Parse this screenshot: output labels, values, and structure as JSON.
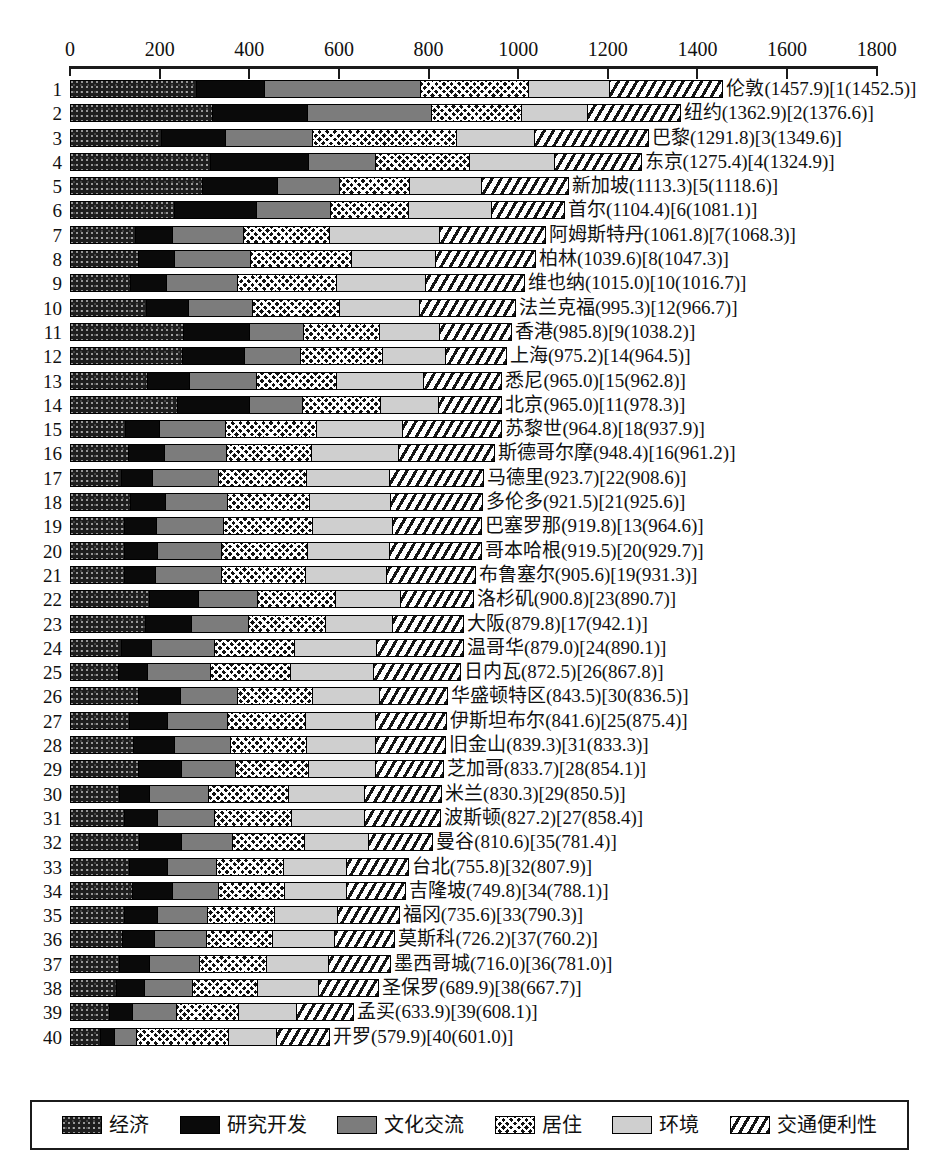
{
  "chart_data": {
    "type": "bar",
    "orientation": "horizontal",
    "stacked": true,
    "title": "",
    "xlabel": "",
    "ylabel": "",
    "xlim": [
      0,
      1800
    ],
    "xticks": [
      0,
      200,
      400,
      600,
      800,
      1000,
      1200,
      1400,
      1600,
      1800
    ],
    "grid": false,
    "legend_position": "bottom",
    "series": [
      {
        "name": "经济",
        "key": "economy",
        "pattern": "dark-speckle"
      },
      {
        "name": "研究开发",
        "key": "rnd",
        "pattern": "solid-black"
      },
      {
        "name": "文化交流",
        "key": "culture",
        "pattern": "solid-gray"
      },
      {
        "name": "居住",
        "key": "living",
        "pattern": "crosshatch"
      },
      {
        "name": "环境",
        "key": "environment",
        "pattern": "light-gray"
      },
      {
        "name": "交通便利性",
        "key": "accessibility",
        "pattern": "diagonal-hatch"
      }
    ],
    "rows": [
      {
        "rank": "1",
        "label": "伦敦(1457.9)[1(1452.5)]",
        "total": 1457.9,
        "values": [
          279,
          154,
          348,
          241,
          182,
          254
        ]
      },
      {
        "rank": "2",
        "label": "纽约(1362.9)[2(1376.6)]",
        "total": 1362.9,
        "values": [
          316,
          212,
          279,
          201,
          148,
          207
        ]
      },
      {
        "rank": "3",
        "label": "巴黎(1291.8)[3(1349.6)]",
        "total": 1291.8,
        "values": [
          202,
          143,
          195,
          322,
          175,
          255
        ]
      },
      {
        "rank": "4",
        "label": "东京(1275.4)[4(1324.9)]",
        "total": 1275.4,
        "values": [
          312,
          218,
          150,
          212,
          190,
          193
        ]
      },
      {
        "rank": "5",
        "label": "新加坡(1113.3)[5(1118.6)]",
        "total": 1113.3,
        "values": [
          294,
          168,
          138,
          158,
          160,
          195
        ]
      },
      {
        "rank": "6",
        "label": "首尔(1104.4)[6(1081.1)]",
        "total": 1104.4,
        "values": [
          230,
          185,
          165,
          175,
          185,
          164
        ]
      },
      {
        "rank": "7",
        "label": "阿姆斯特丹(1061.8)[7(1068.3)]",
        "total": 1061.8,
        "values": [
          144,
          82,
          160,
          193,
          246,
          237
        ]
      },
      {
        "rank": "8",
        "label": "柏林(1039.6)[8(1047.3)]",
        "total": 1039.6,
        "values": [
          150,
          80,
          172,
          225,
          188,
          225
        ]
      },
      {
        "rank": "9",
        "label": "维也纳(1015.0)[10(1016.7)]",
        "total": 1015.0,
        "values": [
          132,
          80,
          160,
          222,
          200,
          221
        ]
      },
      {
        "rank": "10",
        "label": "法兰克福(995.3)[12(966.7)]",
        "total": 995.3,
        "values": [
          168,
          95,
          142,
          195,
          180,
          215
        ]
      },
      {
        "rank": "11",
        "label": "香港(985.8)[9(1038.2)]",
        "total": 985.8,
        "values": [
          250,
          150,
          120,
          170,
          135,
          161
        ]
      },
      {
        "rank": "12",
        "label": "上海(975.2)[14(964.5)]",
        "total": 975.2,
        "values": [
          248,
          140,
          125,
          185,
          140,
          137
        ]
      },
      {
        "rank": "13",
        "label": "悉尼(965.0)[15(962.8)]",
        "total": 965.0,
        "values": [
          170,
          95,
          150,
          180,
          195,
          175
        ]
      },
      {
        "rank": "14",
        "label": "北京(965.0)[11(978.3)]",
        "total": 965.0,
        "values": [
          238,
          162,
          118,
          175,
          130,
          142
        ]
      },
      {
        "rank": "15",
        "label": "苏黎世(964.8)[18(937.9)]",
        "total": 964.8,
        "values": [
          122,
          75,
          148,
          205,
          192,
          223
        ]
      },
      {
        "rank": "16",
        "label": "斯德哥尔摩(948.4)[16(961.2)]",
        "total": 948.4,
        "values": [
          128,
          80,
          140,
          190,
          195,
          215
        ]
      },
      {
        "rank": "17",
        "label": "马德里(923.7)[22(908.6)]",
        "total": 923.7,
        "values": [
          112,
          70,
          148,
          198,
          185,
          211
        ]
      },
      {
        "rank": "18",
        "label": "多伦多(921.5)[21(925.6)]",
        "total": 921.5,
        "values": [
          132,
          78,
          140,
          185,
          180,
          207
        ]
      },
      {
        "rank": "19",
        "label": "巴塞罗那(919.8)[13(964.6)]",
        "total": 919.8,
        "values": [
          118,
          72,
          150,
          200,
          180,
          200
        ]
      },
      {
        "rank": "20",
        "label": "哥本哈根(919.5)[20(929.7)]",
        "total": 919.5,
        "values": [
          120,
          72,
          145,
          192,
          185,
          206
        ]
      },
      {
        "rank": "21",
        "label": "布鲁塞尔(905.6)[19(931.3)]",
        "total": 905.6,
        "values": [
          118,
          70,
          148,
          190,
          180,
          200
        ]
      },
      {
        "rank": "22",
        "label": "洛杉矶(900.8)[23(890.7)]",
        "total": 900.8,
        "values": [
          175,
          110,
          132,
          175,
          145,
          164
        ]
      },
      {
        "rank": "23",
        "label": "大阪(879.8)[17(942.1)]",
        "total": 879.8,
        "values": [
          165,
          105,
          128,
          172,
          150,
          160
        ]
      },
      {
        "rank": "24",
        "label": "温哥华(879.0)[24(890.1)]",
        "total": 879.0,
        "values": [
          112,
          68,
          140,
          180,
          185,
          194
        ]
      },
      {
        "rank": "25",
        "label": "日内瓦(872.5)[26(867.8)]",
        "total": 872.5,
        "values": [
          105,
          65,
          142,
          180,
          185,
          196
        ]
      },
      {
        "rank": "26",
        "label": "华盛顿特区(843.5)[30(836.5)]",
        "total": 843.5,
        "values": [
          150,
          95,
          128,
          168,
          150,
          153
        ]
      },
      {
        "rank": "27",
        "label": "伊斯坦布尔(841.6)[25(875.4)]",
        "total": 841.6,
        "values": [
          130,
          85,
          135,
          175,
          158,
          159
        ]
      },
      {
        "rank": "28",
        "label": "旧金山(839.3)[31(833.3)]",
        "total": 839.3,
        "values": [
          140,
          92,
          125,
          170,
          155,
          157
        ]
      },
      {
        "rank": "29",
        "label": "芝加哥(833.7)[28(854.1)]",
        "total": 833.7,
        "values": [
          150,
          98,
          120,
          165,
          150,
          151
        ]
      },
      {
        "rank": "30",
        "label": "米兰(830.3)[29(850.5)]",
        "total": 830.3,
        "values": [
          108,
          68,
          132,
          178,
          172,
          172
        ]
      },
      {
        "rank": "31",
        "label": "波斯顿(827.2)[27(858.4)]",
        "total": 827.2,
        "values": [
          118,
          75,
          128,
          172,
          165,
          169
        ]
      },
      {
        "rank": "32",
        "label": "曼谷(810.6)[35(781.4)]",
        "total": 810.6,
        "values": [
          152,
          95,
          115,
          160,
          145,
          144
        ]
      },
      {
        "rank": "33",
        "label": "台北(755.8)[32(807.9)]",
        "total": 755.8,
        "values": [
          130,
          85,
          110,
          152,
          140,
          139
        ]
      },
      {
        "rank": "34",
        "label": "吉隆坡(749.8)[34(788.1)]",
        "total": 749.8,
        "values": [
          138,
          88,
          105,
          148,
          138,
          133
        ]
      },
      {
        "rank": "35",
        "label": "福冈(735.6)[33(790.3)]",
        "total": 735.6,
        "values": [
          118,
          75,
          112,
          150,
          142,
          139
        ]
      },
      {
        "rank": "36",
        "label": "莫斯科(726.2)[37(760.2)]",
        "total": 726.2,
        "values": [
          115,
          72,
          115,
          150,
          138,
          136
        ]
      },
      {
        "rank": "37",
        "label": "墨西哥城(716.0)[36(781.0)]",
        "total": 716.0,
        "values": [
          108,
          68,
          112,
          150,
          140,
          138
        ]
      },
      {
        "rank": "38",
        "label": "圣保罗(689.9)[38(667.7)]",
        "total": 689.9,
        "values": [
          102,
          62,
          108,
          145,
          138,
          135
        ]
      },
      {
        "rank": "39",
        "label": "孟买(633.9)[39(608.1)]",
        "total": 633.9,
        "values": [
          85,
          52,
          98,
          140,
          130,
          129
        ]
      },
      {
        "rank": "40",
        "label": "开罗(579.9)[40(601.0)]",
        "total": 579.9,
        "values": [
          65,
          32,
          50,
          206,
          108,
          119
        ]
      }
    ]
  },
  "legend": {
    "items": [
      {
        "label": "经济"
      },
      {
        "label": "研究开发"
      },
      {
        "label": "文化交流"
      },
      {
        "label": "居住"
      },
      {
        "label": "环境"
      },
      {
        "label": "交通便利性"
      }
    ]
  }
}
